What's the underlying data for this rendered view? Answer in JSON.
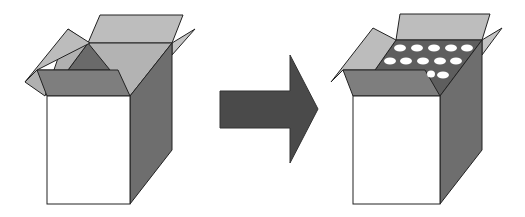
{
  "diagram": {
    "left_box": {
      "state": "empty",
      "label": ""
    },
    "arrow": {
      "direction": "right"
    },
    "right_box": {
      "state": "filled",
      "holes_rows": [
        5,
        5,
        2
      ],
      "label": ""
    },
    "colors": {
      "background": "#ffffff",
      "front_face": "#ffffff",
      "side_face": "#6e6e6e",
      "flap_light": "#b8b8b8",
      "flap_mid": "#8a8a8a",
      "inner_dark": "#5e5e5e",
      "arrow": "#4a4a4a",
      "outline": "#222222",
      "hole": "#ffffff"
    }
  }
}
